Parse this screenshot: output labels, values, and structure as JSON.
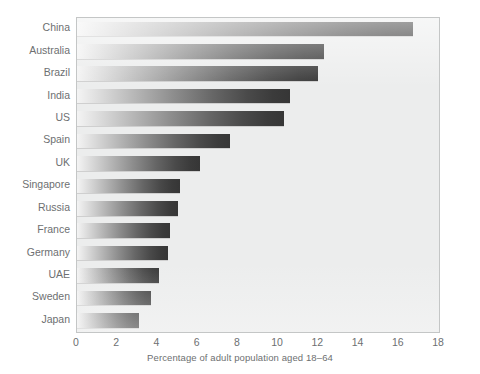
{
  "chart_data": {
    "type": "bar",
    "orientation": "horizontal",
    "title": "",
    "xlabel": "Percentage of adult population aged 18–64",
    "ylabel": "",
    "xlim": [
      0,
      18
    ],
    "xticks": [
      0,
      2,
      4,
      6,
      8,
      10,
      12,
      14,
      16,
      18
    ],
    "grid": false,
    "legend": false,
    "categories": [
      "China",
      "Australia",
      "Brazil",
      "India",
      "US",
      "Spain",
      "UK",
      "Singapore",
      "Russia",
      "France",
      "Germany",
      "UAE",
      "Sweden",
      "Japan"
    ],
    "values": [
      16.7,
      12.3,
      12.0,
      10.6,
      10.3,
      7.6,
      6.1,
      5.1,
      5.0,
      4.6,
      4.5,
      4.1,
      3.7,
      3.1
    ],
    "bars": [
      {
        "label": "China",
        "value": 16.7
      },
      {
        "label": "Australia",
        "value": 12.3
      },
      {
        "label": "Brazil",
        "value": 12.0
      },
      {
        "label": "India",
        "value": 10.6
      },
      {
        "label": "US",
        "value": 10.3
      },
      {
        "label": "Spain",
        "value": 7.6
      },
      {
        "label": "UK",
        "value": 6.1
      },
      {
        "label": "Singapore",
        "value": 5.1
      },
      {
        "label": "Russia",
        "value": 5.0
      },
      {
        "label": "France",
        "value": 4.6
      },
      {
        "label": "Germany",
        "value": 4.5
      },
      {
        "label": "UAE",
        "value": 4.1
      },
      {
        "label": "Sweden",
        "value": 3.7
      },
      {
        "label": "Japan",
        "value": 3.1
      }
    ]
  },
  "colors": {
    "panel_background": "#eceded",
    "panel_border": "#c4c6c6",
    "text": "#6d6f71",
    "bar_gradient_start": "#f4f4f4",
    "bar_gradient_end": "#363636",
    "page_background": "#ffffff"
  }
}
